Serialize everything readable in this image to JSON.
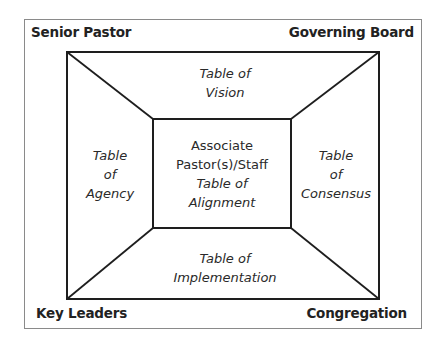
{
  "corners": {
    "top_left": "Senior Pastor",
    "top_right": "Governing Board",
    "bottom_left": "Key Leaders",
    "bottom_right": "Congregation"
  },
  "tables": {
    "top": {
      "line1": "Table of",
      "line2": "Vision"
    },
    "left": {
      "line1": "Table",
      "line2": "of",
      "line3": "Agency"
    },
    "right": {
      "line1": "Table",
      "line2": "of",
      "line3": "Consensus"
    },
    "bottom": {
      "line1": "Table of",
      "line2": "Implementation"
    }
  },
  "center": {
    "line1": "Associate",
    "line2": "Pastor(s)/Staff",
    "line3": "Table of",
    "line4": "Alignment"
  },
  "colors": {
    "line": "#1e1e1e",
    "frame": "#8a8a8a",
    "text": "#222222"
  }
}
